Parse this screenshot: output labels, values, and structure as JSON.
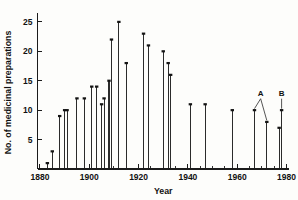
{
  "chart_data": {
    "type": "bar",
    "title": "",
    "subtitle": "",
    "xlabel": "Year",
    "ylabel": "No. of medicinal preparations",
    "xlim": [
      1879,
      1981
    ],
    "ylim": [
      0,
      26
    ],
    "grid": false,
    "legend": null,
    "xticks": [
      1880,
      1900,
      1920,
      1940,
      1960,
      1980
    ],
    "xtick_labels": [
      "1880",
      "1900",
      "1920",
      "1940",
      "1960",
      "1980"
    ],
    "xminor_step": 5,
    "yticks": [
      5,
      10,
      15,
      20,
      25
    ],
    "ytick_labels": [
      "5",
      "10",
      "15",
      "20",
      "25"
    ],
    "x": [
      1883,
      1885,
      1888,
      1890,
      1891,
      1895,
      1898,
      1901,
      1903,
      1905,
      1906,
      1908,
      1909,
      1912,
      1915,
      1922,
      1924,
      1930,
      1932,
      1933,
      1941,
      1947,
      1958,
      1967,
      1972,
      1977,
      1978
    ],
    "values": [
      1,
      3,
      9,
      10,
      10,
      12,
      12,
      14,
      14,
      11,
      12,
      15,
      22,
      25,
      18,
      23,
      21,
      20,
      18,
      16,
      11,
      11,
      10,
      10,
      8,
      7,
      10
    ],
    "annotations": [
      {
        "label": "A",
        "x": 1969.5,
        "y": 12.2,
        "points_to": [
          {
            "x": 1967,
            "y": 10
          },
          {
            "x": 1972,
            "y": 8
          }
        ]
      },
      {
        "label": "B",
        "x": 1978,
        "y": 12.2,
        "points_to": [
          {
            "x": 1978,
            "y": 10
          }
        ]
      }
    ],
    "colors": {
      "bar": "#2b2b2b",
      "axis": "#1b1b1b",
      "background": "#fdfdfb"
    }
  }
}
